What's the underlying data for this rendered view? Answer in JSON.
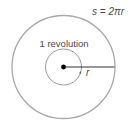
{
  "diagram": {
    "formula": "s = 2πr",
    "inner_label": "1 revolution",
    "radius_label": "r",
    "colors": {
      "outer_circle": "#a8a8a8",
      "inner_circle": "#9a9a9a",
      "radius_line": "#333333",
      "center_dot": "#000000",
      "text": "#4a4a4a"
    }
  }
}
